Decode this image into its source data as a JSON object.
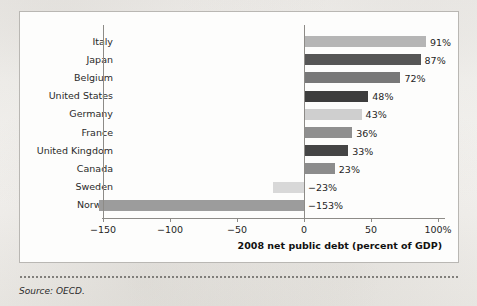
{
  "figure": {
    "partial_top_text": "",
    "source_note": "Source: OECD."
  },
  "axis": {
    "title": "2008 net public debt (percent of GDP)",
    "ticks": [
      {
        "value": -150,
        "label": "−150"
      },
      {
        "value": -100,
        "label": "−100"
      },
      {
        "value": -50,
        "label": "−50"
      },
      {
        "value": 0,
        "label": "0"
      },
      {
        "value": 50,
        "label": "50"
      },
      {
        "value": 100,
        "label": "100%"
      }
    ]
  },
  "chart_data": {
    "type": "bar",
    "orientation": "horizontal",
    "title": "",
    "xlabel": "2008 net public debt (percent of GDP)",
    "ylabel": "",
    "xlim": [
      -160,
      112
    ],
    "grid": false,
    "legend": "none",
    "categories": [
      "Italy",
      "Japan",
      "Belgium",
      "United States",
      "Germany",
      "France",
      "United Kingdom",
      "Canada",
      "Sweden",
      "Norway"
    ],
    "values": [
      91,
      87,
      72,
      48,
      43,
      36,
      33,
      23,
      -23,
      -153
    ],
    "value_labels": [
      "91%",
      "87%",
      "72%",
      "48%",
      "43%",
      "36%",
      "33%",
      "23%",
      "−23%",
      "−153%"
    ],
    "bar_colors": [
      "#b5b5b5",
      "#565656",
      "#787878",
      "#3d3d3d",
      "#cfcfcf",
      "#8f8f8f",
      "#454545",
      "#8c8c8c",
      "#d8d8d8",
      "#9c9c9c"
    ]
  },
  "colors": {
    "frame_border": "#b9b7b3",
    "axis_line": "#8d8b87",
    "plot_background": "#fdfdfc",
    "page_background": "#f2f0ec",
    "text": "#1f1f1f"
  }
}
